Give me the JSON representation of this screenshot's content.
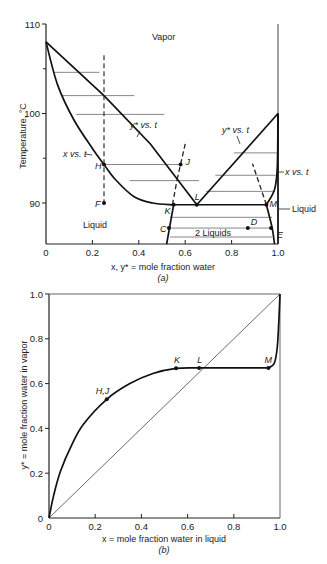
{
  "chart_data": [
    {
      "id": "a",
      "type": "line",
      "title": "",
      "caption": "(a)",
      "xlabel": "x, y* = mole fraction water",
      "ylabel": "Temperature, °C",
      "xlim": [
        0,
        1.0
      ],
      "ylim": [
        85.4,
        110
      ],
      "xticks": [
        "0",
        "0.2",
        "0.4",
        "0.6",
        "0.8",
        "1.0"
      ],
      "yticks": [
        "90",
        "100",
        "110"
      ],
      "region_labels": {
        "vapor": "Vapor",
        "liquid": "Liquid",
        "two_liquids": "2 Liquids",
        "liquid_right": "Liquid"
      },
      "curve_labels": {
        "y_left": "y* vs. t",
        "x_left": "x vs. t",
        "y_right": "y* vs. t",
        "x_right": "x vs. t"
      },
      "series": [
        {
          "name": "y* vs. t (left dew curve)",
          "x": [
            0,
            0.25,
            0.4,
            0.55,
            0.65
          ],
          "y": [
            108,
            102,
            98,
            93.7,
            89.8
          ]
        },
        {
          "name": "x vs. t (left bubble curve)",
          "x": [
            0,
            0.05,
            0.12,
            0.2,
            0.25,
            0.3,
            0.38,
            0.45,
            0.55
          ],
          "y": [
            108,
            103,
            99,
            96,
            94.3,
            92.6,
            90.6,
            90.0,
            89.8
          ]
        },
        {
          "name": "y* vs. t (right dew curve)",
          "x": [
            0.65,
            0.8,
            0.95,
            1.0
          ],
          "y": [
            89.8,
            94.5,
            98.7,
            100
          ]
        },
        {
          "name": "x vs. t (right bubble curve)",
          "x": [
            0.95,
            0.99,
            1.0,
            1.0
          ],
          "y": [
            89.8,
            92,
            95,
            100
          ]
        },
        {
          "name": "solubility left",
          "x": [
            0.55,
            0.53,
            0.52
          ],
          "y": [
            89.8,
            87,
            85.4
          ]
        },
        {
          "name": "solubility right",
          "x": [
            0.95,
            0.97,
            0.985
          ],
          "y": [
            89.8,
            87,
            85.4
          ]
        }
      ],
      "points": [
        {
          "label": "H",
          "x": 0.25,
          "y": 94.3
        },
        {
          "label": "J",
          "x": 0.58,
          "y": 94.3
        },
        {
          "label": "F",
          "x": 0.25,
          "y": 90
        },
        {
          "label": "L",
          "x": 0.65,
          "y": 89.8
        },
        {
          "label": "K",
          "x": 0.55,
          "y": 89.8
        },
        {
          "label": "M",
          "x": 0.95,
          "y": 89.8
        },
        {
          "label": "C",
          "x": 0.53,
          "y": 87.2
        },
        {
          "label": "D",
          "x": 0.87,
          "y": 87.2
        },
        {
          "label": "E",
          "x": 0.97,
          "y": 87.2
        }
      ]
    },
    {
      "id": "b",
      "type": "line",
      "title": "",
      "caption": "(b)",
      "xlabel": "x = mole fraction water in liquid",
      "ylabel": "y* = mole fraction water in vapor",
      "xlim": [
        0,
        1.0
      ],
      "ylim": [
        0,
        1.0
      ],
      "xticks": [
        "0",
        "0.2",
        "0.4",
        "0.6",
        "0.8",
        "1.0"
      ],
      "yticks": [
        "0",
        "0.2",
        "0.4",
        "0.6",
        "0.8",
        "1.0"
      ],
      "series": [
        {
          "name": "equilibrium curve",
          "x": [
            0,
            0.05,
            0.1,
            0.15,
            0.25,
            0.35,
            0.45,
            0.55,
            0.65,
            0.95,
            0.985,
            1.0
          ],
          "y": [
            0,
            0.22,
            0.35,
            0.43,
            0.53,
            0.6,
            0.645,
            0.668,
            0.67,
            0.67,
            0.75,
            1.0
          ]
        },
        {
          "name": "45° diagonal",
          "x": [
            0,
            1
          ],
          "y": [
            0,
            1
          ]
        }
      ],
      "points": [
        {
          "label": "H,J",
          "x": 0.25,
          "y": 0.53
        },
        {
          "label": "K",
          "x": 0.55,
          "y": 0.668
        },
        {
          "label": "L",
          "x": 0.65,
          "y": 0.67
        },
        {
          "label": "M",
          "x": 0.95,
          "y": 0.67
        }
      ]
    }
  ]
}
